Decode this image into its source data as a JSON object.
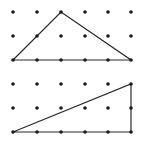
{
  "diagram": {
    "type": "geoboard-triangles",
    "colors": {
      "background": "#ffffff",
      "dot": "#1a1a1a",
      "line": "#2a2a2a"
    },
    "grid": {
      "columns_x": [
        13,
        37,
        61,
        85,
        108,
        131
      ],
      "dot_radius": 1.8
    },
    "panels": [
      {
        "name": "top-grid",
        "rows_y": [
          12,
          36,
          60
        ],
        "triangle": [
          [
            13,
            60
          ],
          [
            61,
            12
          ],
          [
            131,
            60
          ]
        ]
      },
      {
        "name": "bottom-grid",
        "rows_y": [
          84,
          108,
          132
        ],
        "triangle": [
          [
            13,
            132
          ],
          [
            131,
            84
          ],
          [
            131,
            132
          ]
        ]
      }
    ]
  }
}
